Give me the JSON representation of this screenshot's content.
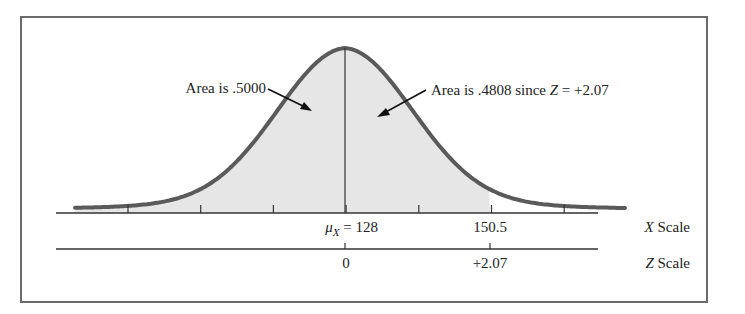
{
  "chart_data": {
    "type": "area",
    "title": "",
    "distribution": {
      "mean": 128,
      "x_value": 150.5,
      "z_value": 2.07
    },
    "annotations": [
      {
        "text": "Area is .5000",
        "points_to": "left half of curve"
      },
      {
        "text_prefix": "Area is .4808 since ",
        "z_symbol": "Z",
        "text_suffix": " = +2.07",
        "points_to": "area between mean and 150.5"
      }
    ],
    "x_axis": {
      "label_symbol": "X",
      "label_word": "Scale",
      "tick_labels": [
        {
          "position": "mean",
          "symbol": "μ",
          "subscript": "X",
          "text": " = 128"
        },
        {
          "position": "150.5",
          "text": "150.5"
        }
      ],
      "tick_count": 7
    },
    "z_axis": {
      "label_symbol": "Z",
      "label_word": "Scale",
      "tick_labels": [
        "0",
        "+2.07"
      ]
    },
    "shaded_region": {
      "from": "left tail",
      "to": 150.5
    },
    "colors": {
      "curve": "#5a5a5a",
      "fill": "#e6e6e6",
      "axis": "#333333",
      "frame": "#6b6b6b"
    }
  }
}
